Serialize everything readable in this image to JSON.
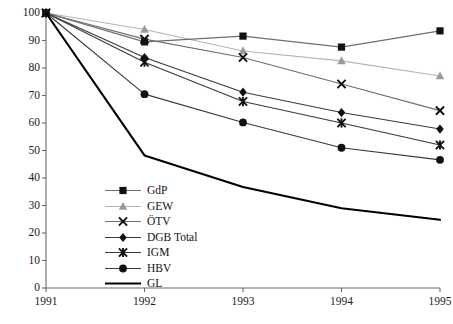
{
  "chart_data": {
    "type": "line",
    "title": "",
    "subtitle": "",
    "xlabel": "",
    "ylabel": "",
    "x": [
      1991,
      1992,
      1993,
      1994,
      1995
    ],
    "categories": [
      "1991",
      "1992",
      "1993",
      "1994",
      "1995"
    ],
    "xlim": [
      1991,
      1995
    ],
    "ylim": [
      0,
      100
    ],
    "yticks": [
      0,
      10,
      20,
      30,
      40,
      50,
      60,
      70,
      80,
      90,
      100
    ],
    "ytick_labels": [
      "0",
      "10",
      "20",
      "30",
      "40",
      "50",
      "60",
      "70",
      "80",
      "90",
      "100"
    ],
    "xtick_labels": [
      "1991",
      "1992",
      "1993",
      "1994",
      "1995"
    ],
    "grid": false,
    "legend_position": "inside lower-left",
    "series": [
      {
        "name": "GdP",
        "marker": "square",
        "marker_color": "#111111",
        "line_color": "#6e6e6e",
        "values": [
          100,
          89.5,
          91.6,
          87.6,
          93.5
        ]
      },
      {
        "name": "GEW",
        "marker": "triangle",
        "marker_color": "#9a9a9a",
        "line_color": "#b4b4b4",
        "values": [
          100,
          94.0,
          86.2,
          82.6,
          77.1
        ]
      },
      {
        "name": "ÖTV",
        "marker": "cross",
        "marker_color": "#111111",
        "line_color": "#6e6e6e",
        "values": [
          100,
          90.5,
          83.8,
          74.2,
          64.5
        ]
      },
      {
        "name": "DGB Total",
        "marker": "diamond",
        "marker_color": "#111111",
        "line_color": "#3a3a3a",
        "values": [
          100,
          83.8,
          71.2,
          63.8,
          57.8
        ]
      },
      {
        "name": "IGM",
        "marker": "star",
        "marker_color": "#111111",
        "line_color": "#3a3a3a",
        "values": [
          100,
          82.1,
          67.8,
          60.0,
          52.0
        ]
      },
      {
        "name": "HBV",
        "marker": "circle",
        "marker_color": "#111111",
        "line_color": "#3a3a3a",
        "values": [
          100,
          70.5,
          60.2,
          51.0,
          46.6
        ]
      },
      {
        "name": "GL",
        "marker": "none",
        "marker_color": "#000000",
        "line_color": "#000000",
        "values": [
          100,
          48.2,
          36.7,
          29.0,
          24.8
        ]
      }
    ]
  },
  "legend": {
    "items": [
      {
        "label": "GdP"
      },
      {
        "label": "GEW"
      },
      {
        "label": "ÖTV"
      },
      {
        "label": "DGB Total"
      },
      {
        "label": "IGM"
      },
      {
        "label": "HBV"
      },
      {
        "label": "GL"
      }
    ]
  },
  "axes": {
    "axis_color": "#6a6a6a"
  }
}
